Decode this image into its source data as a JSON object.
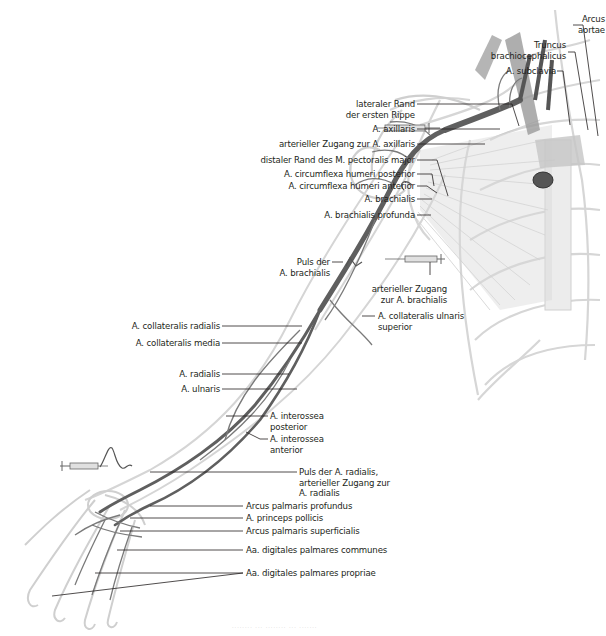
{
  "figure": {
    "colors": {
      "background": "#ffffff",
      "label_text": "#231f20",
      "leader_line": "#231f20",
      "artery": "#5a5a5a",
      "artery_light": "#8c8c8c",
      "bone_outline": "#d3d3d3",
      "muscle": "#bdbdbd"
    },
    "labels": {
      "arcus_aortae": [
        "Arcus",
        "aortae"
      ],
      "truncus_brachiocephalicus": [
        "Truncus",
        "brachiocephalicus"
      ],
      "a_subclavia": "A. subclavia",
      "lateraler_rand": [
        "lateraler Rand",
        "der ersten Rippe"
      ],
      "a_axillaris": "A. axillaris",
      "zugang_axillaris": "arterieller Zugang zur A. axillaris",
      "distaler_rand": "distaler Rand des M. pectoralis major",
      "circumflexa_posterior": "A. circumflexa humeri posterior",
      "circumflexa_anterior": "A. circumflexa humeri anterior",
      "a_brachialis": "A. brachialis",
      "brachialis_profunda": "A. brachialis profunda",
      "puls_brachialis": [
        "Puls der",
        "A. brachialis"
      ],
      "zugang_brachialis": [
        "arterieller Zugang",
        "zur A. brachialis"
      ],
      "collateralis_ulnaris_superior": [
        "A. collateralis ulnaris",
        "superior"
      ],
      "collateralis_radialis": "A. collateralis radialis",
      "collateralis_media": "A. collateralis media",
      "a_radialis": "A. radialis",
      "a_ulnaris": "A. ulnaris",
      "interossea_posterior": [
        "A. interossea",
        "posterior"
      ],
      "interossea_anterior": [
        "A. interossea",
        "anterior"
      ],
      "puls_radialis": [
        "Puls der A. radialis,",
        "arterieller Zugang zur",
        "A. radialis"
      ],
      "arcus_profundus": "Arcus palmaris profundus",
      "princeps_pollicis": "A. princeps pollicis",
      "arcus_superficialis": "Arcus palmaris superficialis",
      "digitales_communes": "Aa. digitales palmares  communes",
      "digitales_propriae": "Aa. digitales palmares propriae"
    },
    "icons": [
      "syringe-icon",
      "pulse-wave-icon",
      "syringe-icon",
      "syringe-icon",
      "pulse-wave-icon",
      "pulse-wave-icon"
    ],
    "caption": "········ ··· ········ ··· ·······"
  }
}
